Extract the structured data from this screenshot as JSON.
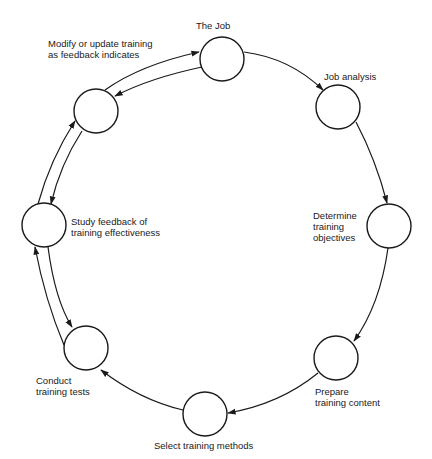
{
  "diagram": {
    "type": "cycle",
    "stroke_color": "#1a1a1a",
    "background": "#ffffff",
    "nodes": [
      {
        "id": "job",
        "label_lines": [
          "The Job"
        ]
      },
      {
        "id": "job-analysis",
        "label_lines": [
          "Job analysis"
        ]
      },
      {
        "id": "determine-objectives",
        "label_lines": [
          "Determine",
          "training",
          "objectives"
        ]
      },
      {
        "id": "prepare-content",
        "label_lines": [
          "Prepare",
          "training content"
        ]
      },
      {
        "id": "select-methods",
        "label_lines": [
          "Select training methods"
        ]
      },
      {
        "id": "conduct-tests",
        "label_lines": [
          "Conduct",
          "training tests"
        ]
      },
      {
        "id": "study-feedback",
        "label_lines": [
          "Study feedback of",
          "training effectiveness"
        ]
      },
      {
        "id": "modify-update",
        "label_lines": [
          "Modify or update training",
          "as feedback indicates"
        ]
      }
    ],
    "edges": [
      {
        "from": "job",
        "to": "job-analysis"
      },
      {
        "from": "job-analysis",
        "to": "determine-objectives"
      },
      {
        "from": "determine-objectives",
        "to": "prepare-content"
      },
      {
        "from": "prepare-content",
        "to": "select-methods"
      },
      {
        "from": "select-methods",
        "to": "conduct-tests"
      },
      {
        "from": "conduct-tests",
        "to": "study-feedback"
      },
      {
        "from": "study-feedback",
        "to": "conduct-tests"
      },
      {
        "from": "study-feedback",
        "to": "modify-update"
      },
      {
        "from": "modify-update",
        "to": "study-feedback"
      },
      {
        "from": "modify-update",
        "to": "job"
      },
      {
        "from": "job",
        "to": "modify-update"
      }
    ]
  }
}
